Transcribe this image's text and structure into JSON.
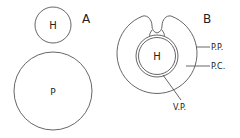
{
  "diagram": {
    "panel_a": {
      "label": "A",
      "small_circle_label": "H",
      "large_circle_label": "P"
    },
    "panel_b": {
      "label": "B",
      "inner_circle_label": "H",
      "callouts": {
        "pp": "P.P.",
        "pc": "P.C.",
        "vp": "V.P."
      }
    },
    "colors": {
      "stroke": "#555555",
      "text": "#222222",
      "background": "#ffffff"
    }
  }
}
